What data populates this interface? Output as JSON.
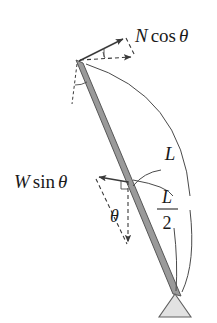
{
  "figure": {
    "background_color": "#ffffff"
  },
  "labels": {
    "normal_force": {
      "text": "N cos θ",
      "parts": {
        "symbol": "N",
        "function": "cos",
        "angle": "θ"
      },
      "x": 135,
      "y": 42
    },
    "weight_component": {
      "text": "W sin θ",
      "parts": {
        "symbol": "W",
        "function": "sin",
        "angle": "θ"
      },
      "x": 14,
      "y": 188
    },
    "length_full": {
      "text": "L",
      "x": 170,
      "y": 160
    },
    "length_half": {
      "numerator": "L",
      "denominator": "2",
      "x": 166,
      "y": 207
    },
    "angle_theta": {
      "text": "θ",
      "x": 114,
      "y": 220
    }
  },
  "geometry": {
    "pivot": {
      "x": 79,
      "y": 61
    },
    "rod_base": {
      "x": 176,
      "y": 295
    },
    "rod_midpoint": {
      "x": 128,
      "y": 178
    },
    "support_triangle": {
      "apex_x": 175,
      "apex_y": 295,
      "left_x": 159,
      "right_x": 191,
      "base_y": 317
    }
  },
  "vectors": {
    "normal": {
      "from_x": 79,
      "from_y": 61,
      "to_x": 125,
      "to_y": 38,
      "style": "solid",
      "label": "N cos θ"
    },
    "normal_horizontal": {
      "from_x": 79,
      "from_y": 61,
      "to_x": 134,
      "to_y": 58,
      "style": "dashed"
    },
    "weight_component_left": {
      "from_x": 128,
      "from_y": 182,
      "to_x": 96,
      "to_y": 176,
      "style": "solid",
      "label": "W sin θ"
    },
    "weight_down": {
      "from_x": 128,
      "from_y": 182,
      "to_x": 128,
      "to_y": 246,
      "style": "dashed"
    }
  },
  "colors": {
    "rod_fill": "#9a9a9a",
    "rod_stroke": "#4a4a4a",
    "line": "#3a3a3a",
    "support_fill": "#e2e2e2",
    "text": "#1a1a1a"
  }
}
